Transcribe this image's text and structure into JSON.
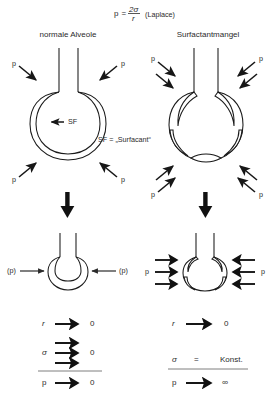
{
  "figure": {
    "type": "diagram",
    "background_color": "#ffffff",
    "ink_color": "#1a1a1a"
  },
  "formula": {
    "lhs": "p",
    "equals": "=",
    "numerator": "2σ",
    "denominator": "r",
    "annotation": "(Laplace)"
  },
  "columns": {
    "left": {
      "title": "normale Alveole",
      "pressure_label": "p",
      "inner_label": "SF",
      "lower_pressure_label": "(p)"
    },
    "right": {
      "title": "Surfactantmangel",
      "pressure_label": "p",
      "lower_pressure_label": "p"
    }
  },
  "legend": {
    "text": "SF = „Surfacant“"
  },
  "results": {
    "left": {
      "radius_symbol": "r",
      "radius_result": "0",
      "sigma_symbol": "σ",
      "sigma_result": "0",
      "pressure_symbol": "p",
      "pressure_result": "0"
    },
    "right": {
      "radius_symbol": "r",
      "radius_result": "0",
      "sigma_symbol": "σ",
      "sigma_relation": "=",
      "sigma_result": "Konst.",
      "pressure_symbol": "p",
      "pressure_result": "∞"
    }
  }
}
